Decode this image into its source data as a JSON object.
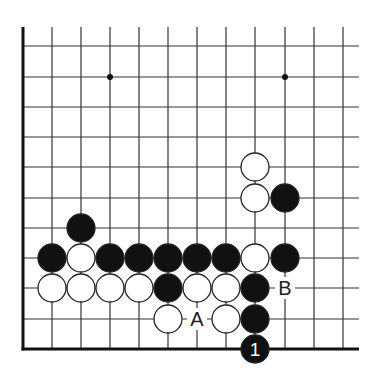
{
  "diagram": {
    "type": "go-board-corner",
    "grid": {
      "columns": 12,
      "rows": 11,
      "col_x": [
        23,
        52,
        81,
        110,
        139,
        168,
        197,
        226,
        255,
        285,
        314,
        343
      ],
      "row_y": [
        46,
        77,
        107,
        137,
        167,
        198,
        228,
        258,
        288,
        319,
        349
      ],
      "line_top": 27,
      "line_right": 359,
      "edges": [
        "left",
        "bottom"
      ],
      "line_color": "#333333",
      "edge_color": "#111111"
    },
    "star_points": [
      {
        "col": 3,
        "row": 1
      },
      {
        "col": 9,
        "row": 1
      }
    ],
    "stones": [
      {
        "color": "black",
        "col": 2,
        "row": 6
      },
      {
        "color": "white",
        "col": 8,
        "row": 4
      },
      {
        "color": "white",
        "col": 8,
        "row": 5
      },
      {
        "color": "black",
        "col": 9,
        "row": 5
      },
      {
        "color": "black",
        "col": 1,
        "row": 7
      },
      {
        "color": "white",
        "col": 2,
        "row": 7
      },
      {
        "color": "black",
        "col": 3,
        "row": 7
      },
      {
        "color": "black",
        "col": 4,
        "row": 7
      },
      {
        "color": "black",
        "col": 5,
        "row": 7
      },
      {
        "color": "black",
        "col": 6,
        "row": 7
      },
      {
        "color": "black",
        "col": 7,
        "row": 7
      },
      {
        "color": "white",
        "col": 8,
        "row": 7
      },
      {
        "color": "black",
        "col": 9,
        "row": 7
      },
      {
        "color": "white",
        "col": 1,
        "row": 8
      },
      {
        "color": "white",
        "col": 2,
        "row": 8
      },
      {
        "color": "white",
        "col": 3,
        "row": 8
      },
      {
        "color": "white",
        "col": 4,
        "row": 8
      },
      {
        "color": "black",
        "col": 5,
        "row": 8
      },
      {
        "color": "white",
        "col": 6,
        "row": 8
      },
      {
        "color": "white",
        "col": 7,
        "row": 8
      },
      {
        "color": "black",
        "col": 8,
        "row": 8
      },
      {
        "color": "white",
        "col": 5,
        "row": 9
      },
      {
        "color": "white",
        "col": 7,
        "row": 9
      },
      {
        "color": "black",
        "col": 8,
        "row": 9
      },
      {
        "color": "black",
        "col": 8,
        "row": 10,
        "label": "1"
      }
    ],
    "markers": [
      {
        "label": "A",
        "col": 6,
        "row": 9
      },
      {
        "label": "B",
        "col": 9,
        "row": 8
      }
    ],
    "colors": {
      "black_stone": "#111111",
      "white_stone": "#ffffff",
      "stone_outline": "#222222",
      "move_number_text": "#ffffff",
      "marker_text": "#222222"
    }
  }
}
